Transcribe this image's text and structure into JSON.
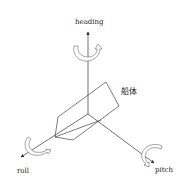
{
  "diagram": {
    "type": "3d-axes",
    "labels": {
      "heading": "heading",
      "roll": "roll",
      "pitch": "pitch",
      "hull": "船体"
    },
    "axes": [
      {
        "name": "heading",
        "direction": "up"
      },
      {
        "name": "roll",
        "direction": "down-left"
      },
      {
        "name": "pitch",
        "direction": "down-right"
      }
    ],
    "colors": {
      "line": "#333333",
      "rotation_arrow_fill": "#ffffff",
      "rotation_arrow_stroke": "#666666"
    }
  }
}
